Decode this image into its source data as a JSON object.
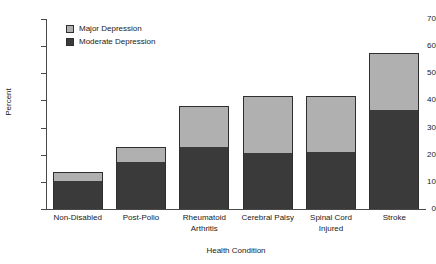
{
  "chart_data": {
    "type": "bar",
    "subtype": "stacked-vertical",
    "title": "",
    "xlabel": "Health Condition",
    "ylabel": "Percent",
    "categories": [
      "Non-Disabled",
      "Post-Polio",
      "Rheumatoid Arthritis",
      "Cerebral Palsy",
      "Spinal Cord Injured",
      "Stroke"
    ],
    "category_lines": [
      [
        "Non-Disabled"
      ],
      [
        "Post-Polio"
      ],
      [
        "Rheumatoid",
        "Arthritis"
      ],
      [
        "Cerebral Palsy"
      ],
      [
        "Spinal Cord",
        "Injured"
      ],
      [
        "Stroke"
      ]
    ],
    "series": [
      {
        "name": "Moderate Depression",
        "color": "#3a3a3a",
        "values": [
          10.5,
          17.5,
          23.0,
          20.5,
          21.0,
          36.5
        ]
      },
      {
        "name": "Major Depression",
        "color": "#b0b0b0",
        "values": [
          3.0,
          5.5,
          15.0,
          21.0,
          20.5,
          21.0
        ]
      }
    ],
    "stack_order": [
      "Moderate Depression",
      "Major Depression"
    ],
    "totals": [
      13.5,
      23.0,
      38.0,
      41.5,
      41.5,
      57.5
    ],
    "ylim": [
      0,
      70
    ],
    "yticks": [
      0,
      10,
      20,
      30,
      40,
      50,
      60,
      70
    ],
    "ytick_labels": [
      "0",
      "10",
      "20",
      "30",
      "40",
      "50",
      "60",
      "70"
    ],
    "grid": false,
    "legend_position": "top-left",
    "legend": [
      {
        "label": "Major Depression",
        "color": "#b0b0b0"
      },
      {
        "label": "Moderate Depression",
        "color": "#3a3a3a"
      }
    ]
  }
}
